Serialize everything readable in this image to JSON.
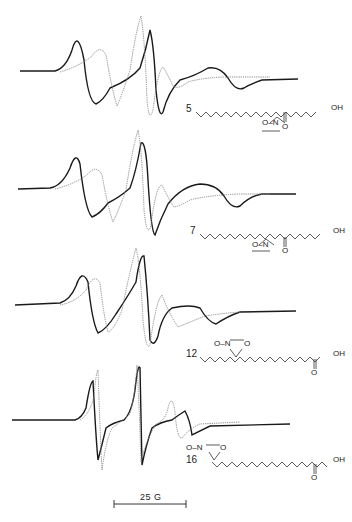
{
  "figure": {
    "type": "EPR spectra of spin-labeled stearic acids",
    "scale_bar": {
      "label": "25 G"
    },
    "legend_styles": {
      "solid": "#1a1a1a",
      "dotted": "#8a8a8a"
    },
    "panels": [
      {
        "label": "5",
        "structure": {
          "o_n": "O–N",
          "ring_o": "O",
          "oh": "OH",
          "carbonyl_o": "O"
        }
      },
      {
        "label": "7",
        "structure": {
          "o_n": "O–N",
          "ring_o": "O",
          "oh": "OH",
          "carbonyl_o": "O"
        }
      },
      {
        "label": "12",
        "structure": {
          "o_n": "O–N",
          "ring_o": "O",
          "oh": "OH",
          "carbonyl_o": "O"
        }
      },
      {
        "label": "16",
        "structure": {
          "o_n": "O–N",
          "ring_o": "O",
          "oh": "OH",
          "carbonyl_o": "O"
        }
      }
    ]
  }
}
